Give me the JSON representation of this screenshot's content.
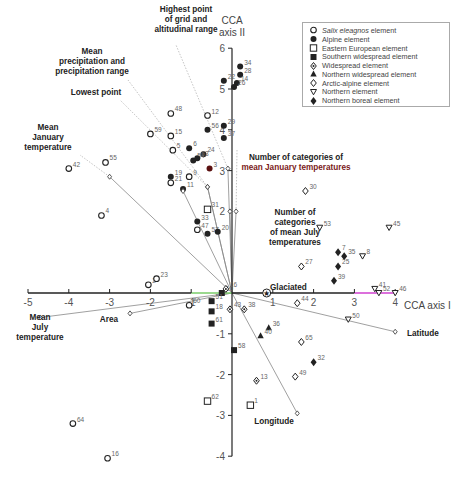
{
  "chart_data": {
    "type": "scatter",
    "title": "",
    "xlabel": "CCA axis I",
    "ylabel": "CCA axis II",
    "xlim": [
      -5,
      4
    ],
    "ylim": [
      -4,
      6
    ],
    "x_ticks": [
      "-5",
      "-4",
      "-3",
      "-2",
      "-1",
      "1",
      "2",
      "3",
      "4"
    ],
    "y_ticks": [
      "6",
      "5",
      "4",
      "3",
      "2",
      "-1",
      "-2",
      "-3",
      "-4"
    ],
    "grid": false,
    "legend_position": "upper right",
    "legend": [
      {
        "shape": "circle-open",
        "label_italic": "Salix eleagnos",
        "label": " element"
      },
      {
        "shape": "circle-filled",
        "label_italic": "",
        "label": "Alpine element"
      },
      {
        "shape": "square-open",
        "label_italic": "",
        "label": "Eastern European element"
      },
      {
        "shape": "square-filled",
        "label_italic": "",
        "label": "Southern widespread element"
      },
      {
        "shape": "diamond-dot",
        "label_italic": "",
        "label": "Widespread element"
      },
      {
        "shape": "triangle-filled",
        "label_italic": "",
        "label": "Northern widespread element"
      },
      {
        "shape": "diamond-open",
        "label_italic": "",
        "label": "Arctic-alpine element"
      },
      {
        "shape": "triangle-down-open",
        "label_italic": "",
        "label": "Northern element"
      },
      {
        "shape": "diamond-filled",
        "label_italic": "",
        "label": "Northern boreal element"
      }
    ],
    "points": [
      {
        "id": "48",
        "x": -1.5,
        "y": 4.4,
        "shape": "circle-open"
      },
      {
        "id": "59",
        "x": -2.0,
        "y": 3.9,
        "shape": "circle-open"
      },
      {
        "id": "15",
        "x": -1.5,
        "y": 3.85,
        "shape": "circle-open"
      },
      {
        "id": "5",
        "x": -1.45,
        "y": 3.5,
        "shape": "circle-open"
      },
      {
        "id": "55",
        "x": -3.1,
        "y": 3.2,
        "shape": "circle-open"
      },
      {
        "id": "42",
        "x": -4.0,
        "y": 3.05,
        "shape": "circle-open"
      },
      {
        "id": "19",
        "x": -1.5,
        "y": 2.85,
        "shape": "circle-filled"
      },
      {
        "id": "21",
        "x": -1.5,
        "y": 2.7,
        "shape": "circle-open"
      },
      {
        "id": "9",
        "x": -1.05,
        "y": 2.85,
        "shape": "circle-open"
      },
      {
        "id": "4",
        "x": -3.2,
        "y": 1.9,
        "shape": "circle-open"
      },
      {
        "id": "47",
        "x": -0.85,
        "y": 1.55,
        "shape": "circle-open"
      },
      {
        "id": "57",
        "x": -0.6,
        "y": 1.45,
        "shape": "circle-filled"
      },
      {
        "id": "12",
        "x": -0.6,
        "y": 4.35,
        "shape": "circle-open"
      },
      {
        "id": "56",
        "x": -0.6,
        "y": 4.0,
        "shape": "circle-filled"
      },
      {
        "id": "22",
        "x": -0.2,
        "y": 5.2,
        "shape": "circle-filled"
      },
      {
        "id": "34",
        "x": 0.2,
        "y": 5.55,
        "shape": "circle-filled"
      },
      {
        "id": "28",
        "x": 0.2,
        "y": 5.35,
        "shape": "circle-filled"
      },
      {
        "id": "14",
        "x": 0.12,
        "y": 5.15,
        "shape": "circle-filled"
      },
      {
        "id": "26",
        "x": 0.05,
        "y": 5.05,
        "shape": "circle-filled"
      },
      {
        "id": "29",
        "x": -0.2,
        "y": 4.1,
        "shape": "circle-filled"
      },
      {
        "id": "37",
        "x": -0.2,
        "y": 3.8,
        "shape": "circle-filled"
      },
      {
        "id": "6",
        "x": -1.05,
        "y": 3.55,
        "shape": "circle-filled"
      },
      {
        "id": "24",
        "x": -0.7,
        "y": 3.4,
        "shape": "circle-filled"
      },
      {
        "id": "54",
        "x": -0.95,
        "y": 3.25,
        "shape": "circle-filled"
      },
      {
        "id": "63",
        "x": -0.85,
        "y": 3.3,
        "shape": "circle-filled"
      },
      {
        "id": "3",
        "x": -0.55,
        "y": 3.05,
        "shape": "circle-filled",
        "color": "#5a1010"
      },
      {
        "id": "11",
        "x": -1.2,
        "y": 2.55,
        "shape": "circle-filled"
      },
      {
        "id": "33",
        "x": -0.85,
        "y": 1.75,
        "shape": "circle-filled"
      },
      {
        "id": "20",
        "x": -0.35,
        "y": 1.5,
        "shape": "circle-filled"
      },
      {
        "id": "31",
        "x": -0.6,
        "y": 2.05,
        "shape": "square-open"
      },
      {
        "id": "2",
        "x": -2.05,
        "y": 0.2,
        "shape": "circle-open"
      },
      {
        "id": "23",
        "x": -1.85,
        "y": 0.35,
        "shape": "circle-open"
      },
      {
        "id": "10",
        "x": -0.25,
        "y": 0.0,
        "shape": "square-filled"
      },
      {
        "id": "16",
        "x": -0.15,
        "y": 0.1,
        "shape": "diamond-dot"
      },
      {
        "id": "60",
        "x": -1.05,
        "y": -0.3,
        "shape": "circle-open"
      },
      {
        "id": "51",
        "x": -0.5,
        "y": -0.2,
        "shape": "square-filled"
      },
      {
        "id": "18",
        "x": -0.5,
        "y": -0.45,
        "shape": "square-filled"
      },
      {
        "id": "61",
        "x": -0.5,
        "y": -0.75,
        "shape": "square-filled"
      },
      {
        "id": "43",
        "x": -0.05,
        "y": -0.4,
        "shape": "diamond-dot"
      },
      {
        "id": "38",
        "x": 0.3,
        "y": -0.4,
        "shape": "diamond-dot"
      },
      {
        "id": "58",
        "x": 0.05,
        "y": -1.4,
        "shape": "square-filled"
      },
      {
        "id": "36",
        "x": 0.9,
        "y": -0.85,
        "shape": "triangle-filled"
      },
      {
        "id": "40",
        "x": 0.7,
        "y": -1.05,
        "shape": "triangle-filled"
      },
      {
        "id": "13",
        "x": 0.6,
        "y": -2.15,
        "shape": "diamond-dot"
      },
      {
        "id": "65",
        "x": 1.7,
        "y": -1.2,
        "shape": "diamond-open"
      },
      {
        "id": "49",
        "x": 1.55,
        "y": -2.05,
        "shape": "diamond-open"
      },
      {
        "id": "32",
        "x": 2.0,
        "y": -1.7,
        "shape": "diamond-filled"
      },
      {
        "id": "44",
        "x": 1.6,
        "y": -0.25,
        "shape": "diamond-open"
      },
      {
        "id": "27",
        "x": 1.7,
        "y": 0.65,
        "shape": "diamond-open"
      },
      {
        "id": "30",
        "x": 1.8,
        "y": 2.5,
        "shape": "diamond-open"
      },
      {
        "id": "53",
        "x": 2.15,
        "y": 1.6,
        "shape": "triangle-down-open"
      },
      {
        "id": "45",
        "x": 3.85,
        "y": 1.6,
        "shape": "triangle-down-open"
      },
      {
        "id": "7",
        "x": 2.6,
        "y": 1.0,
        "shape": "diamond-filled"
      },
      {
        "id": "35",
        "x": 2.75,
        "y": 0.9,
        "shape": "diamond-filled"
      },
      {
        "id": "8",
        "x": 3.2,
        "y": 0.9,
        "shape": "triangle-down-open"
      },
      {
        "id": "25",
        "x": 2.6,
        "y": 0.65,
        "shape": "diamond-filled"
      },
      {
        "id": "39",
        "x": 2.5,
        "y": 0.3,
        "shape": "diamond-filled"
      },
      {
        "id": "41",
        "x": 3.5,
        "y": 0.1,
        "shape": "triangle-down-open"
      },
      {
        "id": "52",
        "x": 3.6,
        "y": 0.0,
        "shape": "triangle-down-open"
      },
      {
        "id": "46",
        "x": 4.0,
        "y": 0.0,
        "shape": "triangle-down-open"
      },
      {
        "id": "50",
        "x": 2.85,
        "y": -0.65,
        "shape": "triangle-down-open"
      },
      {
        "id": "62",
        "x": -0.6,
        "y": -2.65,
        "shape": "square-open"
      },
      {
        "id": "1",
        "x": 0.45,
        "y": -2.75,
        "shape": "square-open"
      },
      {
        "id": "64",
        "x": -3.9,
        "y": -3.2,
        "shape": "circle-open"
      },
      {
        "id": "16b",
        "label": "16",
        "x": -3.05,
        "y": -4.05,
        "shape": "circle-open"
      }
    ],
    "vectors": [
      {
        "label": "Highest point of grid and altitudinal range",
        "x": -0.1,
        "y": 3.05,
        "lines": [
          "Highest point",
          "of grid and",
          "altitudinal range"
        ],
        "lx": 186,
        "ly": 12,
        "line_to": [
          176,
          45
        ]
      },
      {
        "label": "Mean precipitation and precipitation range",
        "x": -0.6,
        "y": 2.6,
        "lines": [
          "Mean",
          "precipitation and",
          "precipitation range"
        ],
        "lx": 92,
        "ly": 54,
        "line_to": [
          128,
          80
        ]
      },
      {
        "label": "Lowest point",
        "x": -0.6,
        "y": 2.6,
        "lines": [
          "Lowest point"
        ],
        "lx": 96,
        "ly": 95,
        "line_to": [
          120,
          100
        ]
      },
      {
        "label": "Mean January temperature",
        "x": -3.0,
        "y": 2.85,
        "lines": [
          "Mean",
          "January",
          "temperature"
        ],
        "lx": 48,
        "ly": 130,
        "line_to": [
          80,
          155
        ]
      },
      {
        "label": "Number of categories of mean January temperatures",
        "x": 0.1,
        "y": 2.0,
        "lines": [
          "Number of categories of",
          "mean January temperatures"
        ],
        "lx": 296,
        "ly": 160,
        "line_to": [
          237,
          150
        ],
        "label_color2": "#7a1a1a"
      },
      {
        "label": "Number of categories of mean July temperatures",
        "x": -0.05,
        "y": 2.0,
        "lines": [
          "Number of",
          "categories",
          "of mean July",
          "temperatures"
        ],
        "lx": 295,
        "ly": 215,
        "line_to": null
      },
      {
        "label": "Mean July temperature",
        "x": -4.7,
        "y": -0.6,
        "lines": [
          "Mean",
          "July",
          "temperature"
        ],
        "lx": 40,
        "ly": 320
      },
      {
        "label": "Area",
        "x": -2.5,
        "y": -0.5,
        "lines": [
          "Area"
        ],
        "lx": 118,
        "ly": 322
      },
      {
        "label": "Glaciated",
        "x": 0.85,
        "y": 0.0,
        "lines": [
          "Glaciated"
        ],
        "lx": 270,
        "ly": 290
      },
      {
        "label": "Latitude",
        "x": 4.0,
        "y": -0.95,
        "lines": [
          "Latitude"
        ],
        "lx": 407,
        "ly": 336
      },
      {
        "label": "Longitude",
        "x": 1.6,
        "y": -2.95,
        "lines": [
          "Longitude"
        ],
        "lx": 274,
        "ly": 424
      },
      {
        "label": "Widespread centroid",
        "x": -1.2,
        "y": 2.5,
        "lines": [],
        "lx": 0,
        "ly": 0
      }
    ]
  },
  "axes": {
    "x_label": "CCA axis I",
    "y_label_line1": "CCA",
    "y_label_line2": "axis II"
  },
  "colors": {
    "axis": "#222222",
    "marker": "#222222",
    "vector": "#888888",
    "label_num": "#666666",
    "x_axis_green": "#7acc6a",
    "x_axis_magenta": "#d040d0"
  }
}
